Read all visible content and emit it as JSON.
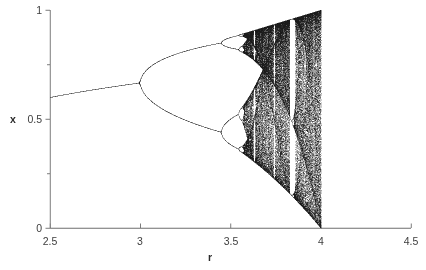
{
  "figure": {
    "background_color": "#ffffff",
    "axis_color": "#6e6e6e",
    "point_color": "#1a1a1a"
  },
  "axes": {
    "x_title": "r",
    "y_title": "x",
    "x_ticks": [
      "2.5",
      "3",
      "3.5",
      "4",
      "4.5"
    ],
    "y_ticks": [
      "0",
      "0.5",
      "1"
    ]
  },
  "chart_data": {
    "type": "scatter",
    "title": "",
    "subtitle": "",
    "xlabel": "r",
    "ylabel": "x",
    "xlim": [
      2.5,
      4.5
    ],
    "ylim": [
      0,
      1
    ],
    "xticks": [
      2.5,
      3,
      3.5,
      4,
      4.5
    ],
    "xticklabels": [
      "2.5",
      "3",
      "3.5",
      "4",
      "4.5"
    ],
    "yticks": [
      0,
      0.5,
      1
    ],
    "yticklabels": [
      "0",
      "0.5",
      "1"
    ],
    "minor_xticks": [
      2.75,
      3.25,
      3.75,
      4.25
    ],
    "minor_yticks": [
      0.25,
      0.75
    ],
    "grid": false,
    "legend": null,
    "equation": "x_(n+1) = r * x_n * (1 - x_n)",
    "data_r_range": [
      2.5,
      4.0
    ],
    "r_samples": 1400,
    "iterations_transient": 300,
    "iterations_plotted": 220,
    "x_initial": 0.3,
    "features": [
      {
        "name": "fixed-point-branch",
        "r_range": [
          2.5,
          3.0
        ],
        "x_at_r_start": 0.6,
        "x_at_r_end": 0.667
      },
      {
        "name": "period-2-onset",
        "r": 3.0,
        "x": 0.667
      },
      {
        "name": "period-4-onset",
        "r": 3.449,
        "x_upper": 0.85,
        "x_lower": 0.44
      },
      {
        "name": "period-8-onset",
        "r": 3.544
      },
      {
        "name": "chaos-onset",
        "r": 3.57
      },
      {
        "name": "period-3-window",
        "r_range": [
          3.828,
          3.857
        ]
      },
      {
        "name": "period-5-window",
        "r_range": [
          3.738,
          3.745
        ]
      },
      {
        "name": "period-6-window",
        "r_range": [
          3.626,
          3.635
        ]
      },
      {
        "name": "full-chaos-endpoint",
        "r": 4.0,
        "x_range": [
          0,
          1
        ]
      }
    ]
  }
}
